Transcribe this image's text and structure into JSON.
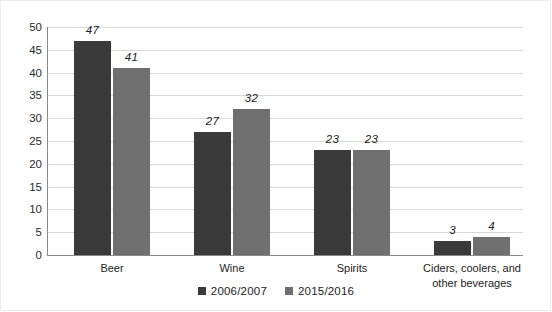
{
  "chart_data": {
    "type": "bar",
    "title": "",
    "subtitle": "",
    "xlabel": "",
    "ylabel": "",
    "ylim": [
      0,
      50
    ],
    "ytick_step": 5,
    "yticks": [
      0,
      5,
      10,
      15,
      20,
      25,
      30,
      35,
      40,
      45,
      50
    ],
    "ytick_labels": [
      "0",
      "5",
      "10",
      "15",
      "20",
      "25",
      "30",
      "35",
      "40",
      "45",
      "50"
    ],
    "grid": true,
    "grid_axis": "y",
    "legend_position": "bottom-center",
    "categories": [
      "Beer",
      "Wine",
      "Spirits",
      "Ciders, coolers, and\nother beverages"
    ],
    "series": [
      {
        "name": "2006/2007",
        "color": "#3a3a3a",
        "values": [
          47,
          27,
          23,
          3
        ],
        "value_labels": [
          "47",
          "27",
          "23",
          "3"
        ]
      },
      {
        "name": "2015/2016",
        "color": "#6f6f6f",
        "values": [
          41,
          32,
          23,
          4
        ],
        "value_labels": [
          "41",
          "32",
          "23",
          "4"
        ]
      }
    ]
  },
  "legend": {
    "items": [
      {
        "label": "2006/2007",
        "color": "#3a3a3a"
      },
      {
        "label": "2015/2016",
        "color": "#6f6f6f"
      }
    ]
  },
  "colors": {
    "series_1": "#3a3a3a",
    "series_2": "#6f6f6f",
    "gridline": "#d9d9d9",
    "axis": "#8a8a8a",
    "text": "#232323",
    "background": "#ffffff"
  }
}
